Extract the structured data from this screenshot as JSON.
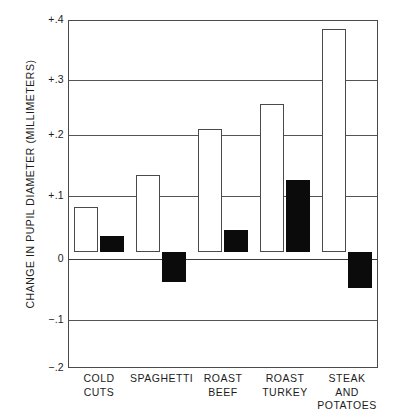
{
  "chart_data": {
    "type": "bar",
    "title": "",
    "xlabel": "",
    "ylabel": "CHANGE IN PUPIL DIAMETER (MILLIMETERS)",
    "categories": [
      "COLD CUTS",
      "SPAGHETTI",
      "ROAST BEEF",
      "ROAST TURKEY",
      "STEAK AND POTATOES"
    ],
    "category_lines": [
      [
        "COLD",
        "CUTS"
      ],
      [
        "SPAGHETTI"
      ],
      [
        "ROAST",
        "BEEF"
      ],
      [
        "ROAST",
        "TURKEY"
      ],
      [
        "STEAK AND",
        "POTATOES"
      ]
    ],
    "series": [
      {
        "name": "white-bar",
        "fill": "#ffffff",
        "values": [
          0.078,
          0.133,
          0.212,
          0.256,
          0.385
        ]
      },
      {
        "name": "black-bar",
        "fill": "#0b0b0b",
        "values": [
          0.028,
          -0.051,
          0.038,
          0.125,
          -0.062
        ]
      }
    ],
    "ylim": [
      -0.2,
      0.4
    ],
    "yticks": [
      0.4,
      0.3,
      0.2,
      0.1,
      0,
      -0.1,
      -0.2
    ],
    "ytick_labels": [
      "+.4",
      "+.3",
      "+.2",
      "+.1",
      "0",
      "−.1",
      "−.2"
    ],
    "grid": true,
    "grid_axis": "y",
    "legend": "none",
    "zero_reference": 0
  },
  "colors": {
    "axis": "#4a4a4a",
    "grid": "#555555",
    "bar_white_fill": "#ffffff",
    "bar_black_fill": "#0b0b0b",
    "text": "#1c1c1c",
    "background": "#ffffff"
  }
}
